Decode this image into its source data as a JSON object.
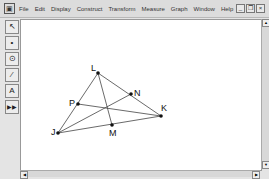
{
  "menubar": {
    "items": [
      "File",
      "Edit",
      "Display",
      "Construct",
      "Transform",
      "Measure",
      "Graph",
      "Window",
      "Help"
    ]
  },
  "window_controls": {
    "minimize": "_",
    "restore": "❐",
    "close": "×"
  },
  "toolbox": {
    "tools": [
      {
        "name": "arrow-tool",
        "glyph": "↖"
      },
      {
        "name": "point-tool",
        "glyph": "•"
      },
      {
        "name": "compass-tool",
        "glyph": "⊙"
      },
      {
        "name": "line-tool",
        "glyph": "⁄"
      },
      {
        "name": "text-tool",
        "glyph": "A"
      },
      {
        "name": "custom-tool",
        "glyph": "▶▶"
      }
    ]
  },
  "figure": {
    "points": {
      "L": {
        "label": "L",
        "x": 98,
        "y": 73
      },
      "N": {
        "label": "N",
        "x": 131,
        "y": 94
      },
      "P": {
        "label": "P",
        "x": 78,
        "y": 104
      },
      "K": {
        "label": "K",
        "x": 161,
        "y": 116
      },
      "M": {
        "label": "M",
        "x": 112,
        "y": 125
      },
      "J": {
        "label": "J",
        "x": 58,
        "y": 133
      }
    }
  }
}
